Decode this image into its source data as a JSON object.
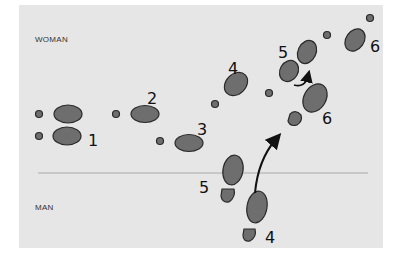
{
  "diagram": {
    "labels": {
      "woman": "WOMAN",
      "man": "MAN"
    },
    "step_numbers": {
      "w1": "1",
      "w2": "2",
      "w3": "3",
      "w4": "4",
      "w5": "5",
      "w6": "6",
      "w6b": "6",
      "m4": "4",
      "m5": "5"
    },
    "colors": {
      "paper": "#e6e6e6",
      "foot_fill": "#6e6e6e",
      "foot_stroke": "#2a2a2a",
      "divider": "#c8c8c8"
    }
  }
}
